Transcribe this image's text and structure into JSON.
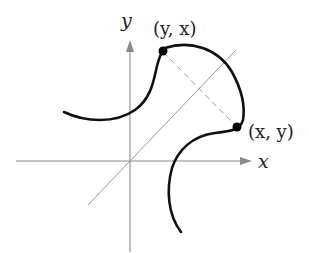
{
  "diagram": {
    "title": "",
    "axes": {
      "x_label": "x",
      "y_label": "y",
      "axis_color": "#8a8a8a"
    },
    "diagonal_line": {
      "label": "",
      "color": "#9a9a9a"
    },
    "points": [
      {
        "id": "reflected",
        "label": "(y, x)",
        "color": "#000000"
      },
      {
        "id": "original",
        "label": "(x, y)",
        "color": "#000000"
      }
    ],
    "connector": {
      "style": "dashed",
      "color": "#9a9a9a"
    },
    "curve_color": "#111111"
  }
}
